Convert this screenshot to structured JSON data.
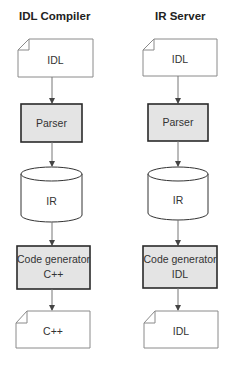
{
  "columns": [
    {
      "title": "IDL Compiler",
      "input": {
        "label": "IDL"
      },
      "parser": {
        "label": "Parser"
      },
      "repository": {
        "label": "IR"
      },
      "generator": {
        "line1": "Code generator",
        "line2": "C++"
      },
      "output": {
        "label": "C++"
      }
    },
    {
      "title": "IR Server",
      "input": {
        "label": "IDL"
      },
      "parser": {
        "label": "Parser"
      },
      "repository": {
        "label": "IR"
      },
      "generator": {
        "line1": "Code generator",
        "line2": "IDL"
      },
      "output": {
        "label": "IDL"
      }
    }
  ],
  "colors": {
    "process_fill": "#e4e4e4",
    "process_stroke": "#2a2a2a",
    "doc_stroke": "#777777",
    "arrow": "#666666"
  }
}
